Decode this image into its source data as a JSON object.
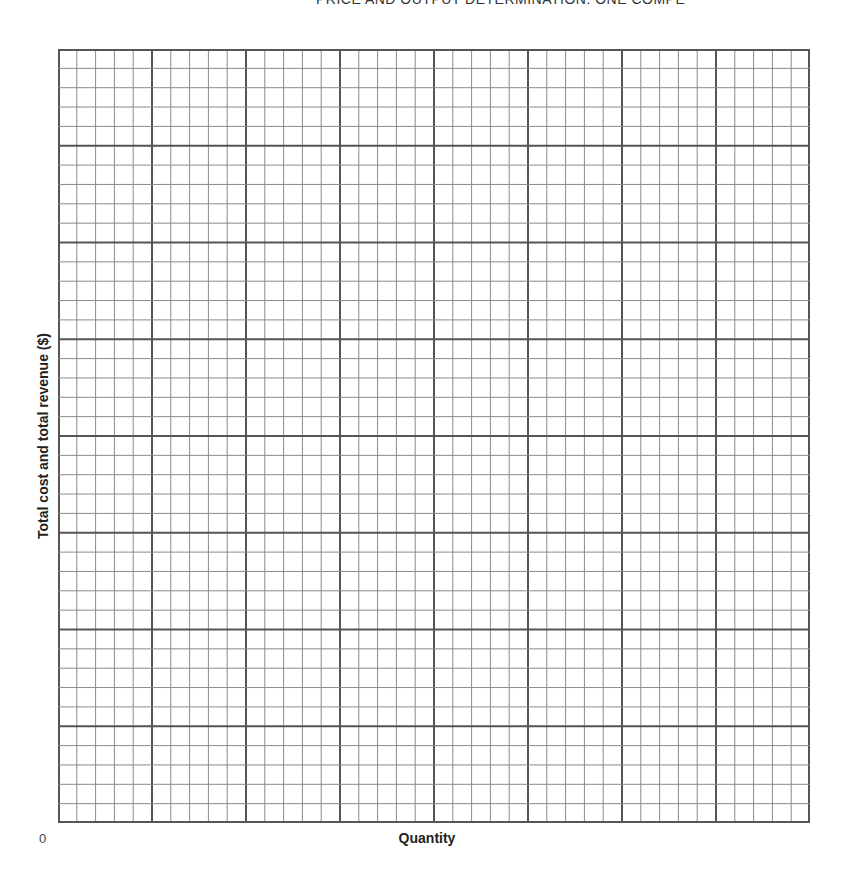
{
  "header": {
    "running_title": "PRICE AND OUTPUT DETERMINATION: ONE COMPE"
  },
  "chart_data": {
    "type": "line",
    "title": "",
    "xlabel": "Quantity",
    "ylabel": "Total cost and total revenue ($)",
    "origin_label": "0",
    "x_tick_labels": [],
    "y_tick_labels": [],
    "series": [],
    "grid": {
      "enabled": true,
      "major_columns": 8,
      "major_rows": 8,
      "minor_per_major": 5,
      "minor_color": "#8a8a8a",
      "major_color": "#555555"
    }
  }
}
